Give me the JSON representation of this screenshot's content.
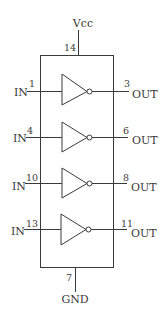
{
  "diagram": {
    "type": "ic-pinout-hex-inverter",
    "supply": {
      "label": "Vcc",
      "pin": "14"
    },
    "ground": {
      "label": "GND",
      "pin": "7"
    },
    "gates": [
      {
        "input_label": "IN",
        "input_pin": "1",
        "output_pin": "3",
        "output_label": "OUT"
      },
      {
        "input_label": "IN",
        "input_pin": "4",
        "output_pin": "6",
        "output_label": "OUT"
      },
      {
        "input_label": "IN",
        "input_pin": "10",
        "output_pin": "8",
        "output_label": "OUT"
      },
      {
        "input_label": "IN",
        "input_pin": "13",
        "output_pin": "11",
        "output_label": "OUT"
      }
    ],
    "colors": {
      "line": "#3a3a3a",
      "background": "#ffffff"
    }
  }
}
